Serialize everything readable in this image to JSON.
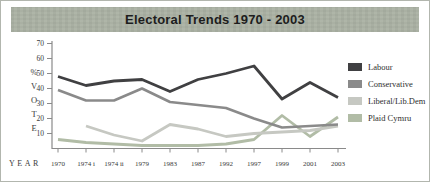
{
  "title": "Electoral Trends 1970 - 2003",
  "colors": {
    "title_bar_bg": "#ccd0c8",
    "title_text": "#1d1d1d",
    "axis": "#8a8a8a",
    "labour": "#404042",
    "conservative": "#8a8a8a",
    "liberal": "#c6c8c2",
    "plaid_cymru": "#b1bca6"
  },
  "chart_data": {
    "type": "line",
    "title": "Electoral Trends 1970 - 2003",
    "categories": [
      "1970",
      "1974 i",
      "1974 ii",
      "1979",
      "1983",
      "1987",
      "1992",
      "1997",
      "1999",
      "2001",
      "2003"
    ],
    "series": [
      {
        "name": "Labour",
        "color": "#404042",
        "width": 2.8,
        "values": [
          48,
          42,
          45,
          46,
          38,
          46,
          50,
          55,
          33,
          44,
          34
        ]
      },
      {
        "name": "Conservative",
        "color": "#8a8a8a",
        "width": 2.6,
        "values": [
          39,
          32,
          32,
          40,
          31,
          29,
          27,
          20,
          14,
          15,
          16
        ]
      },
      {
        "name": "Liberal/Lib.Dem",
        "color": "#c6c8c2",
        "width": 2.8,
        "values": [
          null,
          15,
          9,
          5,
          16,
          13,
          8,
          10,
          11,
          12,
          15
        ]
      },
      {
        "name": "Plaid Cymru",
        "color": "#b1bca6",
        "width": 2.8,
        "values": [
          6,
          4,
          3,
          2,
          2,
          2,
          3,
          6,
          22,
          8,
          21
        ]
      }
    ],
    "xlabel": "YEAR",
    "ylabel_chars": [
      "%",
      "V",
      "O",
      "T",
      "E"
    ],
    "ylim": [
      0,
      70
    ],
    "yticks": [
      70,
      60,
      50,
      40,
      30,
      20,
      10
    ],
    "grid": false,
    "legend_position": "right"
  }
}
